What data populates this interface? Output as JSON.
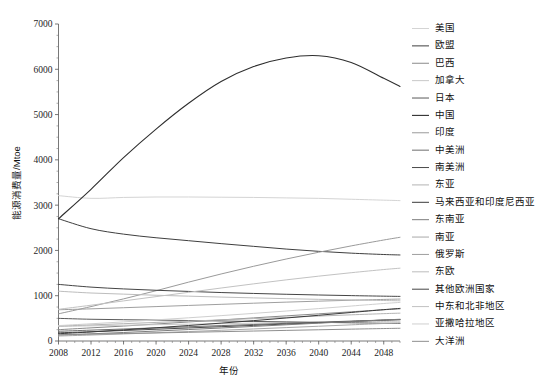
{
  "chart_data": {
    "type": "line",
    "title": "",
    "xlabel": "年份",
    "ylabel": "能源消费量/Mtoe",
    "xlim": [
      2008,
      2050
    ],
    "ylim": [
      0,
      7000
    ],
    "grid": false,
    "legend_position": "right",
    "xticks": [
      2008,
      2012,
      2016,
      2020,
      2024,
      2028,
      2032,
      2036,
      2040,
      2044,
      2048
    ],
    "yticks": [
      0,
      1000,
      2000,
      3000,
      4000,
      5000,
      6000,
      7000
    ],
    "xtick_labels": [
      "2008",
      "2012",
      "2016",
      "2020",
      "2024",
      "2028",
      "2032",
      "2036",
      "2040",
      "2044",
      "2048"
    ],
    "ytick_labels": [
      "0",
      "1000",
      "2000",
      "3000",
      "4000",
      "5000",
      "6000",
      "7000"
    ],
    "x": [
      2008,
      2012,
      2016,
      2020,
      2024,
      2028,
      2032,
      2036,
      2040,
      2044,
      2048,
      2050
    ],
    "series": [
      {
        "name": "美国",
        "color": "#d4d4d4",
        "width": 1.0,
        "values": [
          3210,
          3150,
          3170,
          3180,
          3180,
          3175,
          3170,
          3160,
          3150,
          3130,
          3110,
          3100
        ]
      },
      {
        "name": "欧盟",
        "color": "#3f3f3f",
        "width": 1.0,
        "values": [
          2700,
          2480,
          2360,
          2280,
          2215,
          2150,
          2090,
          2030,
          1980,
          1940,
          1910,
          1900
        ]
      },
      {
        "name": "巴西",
        "color": "#8a8a8a",
        "width": 1.0,
        "values": [
          250,
          290,
          330,
          375,
          420,
          465,
          510,
          555,
          600,
          645,
          690,
          710
        ]
      },
      {
        "name": "加拿大",
        "color": "#c9c9c9",
        "width": 1.0,
        "values": [
          320,
          335,
          348,
          360,
          372,
          383,
          394,
          404,
          414,
          423,
          432,
          436
        ]
      },
      {
        "name": "日本",
        "color": "#5a5a5a",
        "width": 1.0,
        "values": [
          500,
          480,
          470,
          462,
          452,
          442,
          432,
          422,
          412,
          402,
          392,
          388
        ]
      },
      {
        "name": "中国",
        "color": "#2e2e2e",
        "width": 1.1,
        "values": [
          2700,
          3350,
          4050,
          4680,
          5250,
          5730,
          6060,
          6250,
          6300,
          6150,
          5800,
          5620
        ]
      },
      {
        "name": "印度",
        "color": "#9a9a9a",
        "width": 1.0,
        "values": [
          600,
          760,
          930,
          1110,
          1300,
          1480,
          1650,
          1810,
          1960,
          2100,
          2230,
          2290
        ]
      },
      {
        "name": "中美洲",
        "color": "#6e6e6e",
        "width": 1.0,
        "values": [
          215,
          240,
          265,
          290,
          315,
          340,
          365,
          390,
          415,
          440,
          462,
          472
        ]
      },
      {
        "name": "南美洲",
        "color": "#4a4a4a",
        "width": 1.0,
        "values": [
          180,
          205,
          232,
          260,
          288,
          316,
          345,
          374,
          403,
          432,
          460,
          472
        ]
      },
      {
        "name": "东亚",
        "color": "#b4b4b4",
        "width": 1.0,
        "values": [
          330,
          355,
          382,
          410,
          438,
          466,
          494,
          522,
          550,
          578,
          604,
          615
        ]
      },
      {
        "name": "马来西亚和印度尼西亚",
        "color": "#3a3a3a",
        "width": 1.0,
        "values": [
          160,
          200,
          245,
          292,
          342,
          395,
          450,
          508,
          568,
          630,
          692,
          720
        ]
      },
      {
        "name": "东南亚",
        "color": "#7d7d7d",
        "width": 1.0,
        "values": [
          130,
          158,
          188,
          220,
          253,
          287,
          322,
          358,
          394,
          430,
          464,
          480
        ]
      },
      {
        "name": "南亚",
        "color": "#a8a8a8",
        "width": 1.0,
        "values": [
          110,
          132,
          156,
          182,
          209,
          237,
          266,
          296,
          326,
          357,
          387,
          400
        ]
      },
      {
        "name": "俄罗斯",
        "color": "#9f9f9f",
        "width": 1.0,
        "values": [
          690,
          710,
          735,
          760,
          785,
          810,
          835,
          858,
          880,
          900,
          918,
          926
        ]
      },
      {
        "name": "东欧",
        "color": "#bdbdbd",
        "width": 1.0,
        "values": [
          1100,
          1060,
          1035,
          1010,
          990,
          970,
          952,
          935,
          920,
          906,
          894,
          888
        ]
      },
      {
        "name": "其他欧洲国家",
        "color": "#454545",
        "width": 1.0,
        "values": [
          1250,
          1190,
          1150,
          1120,
          1095,
          1070,
          1050,
          1032,
          1016,
          1002,
          990,
          985
        ]
      },
      {
        "name": "中东和北非地区",
        "color": "#c2c2c2",
        "width": 1.0,
        "values": [
          700,
          790,
          885,
          980,
          1075,
          1170,
          1262,
          1350,
          1432,
          1508,
          1578,
          1608
        ]
      },
      {
        "name": "亚撒哈拉地区",
        "color": "#cfcfcf",
        "width": 1.0,
        "values": [
          340,
          380,
          422,
          466,
          512,
          560,
          610,
          662,
          716,
          772,
          828,
          852
        ]
      },
      {
        "name": "大洋洲",
        "color": "#8f8f8f",
        "width": 1.0,
        "values": [
          140,
          152,
          165,
          178,
          192,
          206,
          220,
          234,
          248,
          262,
          275,
          281
        ]
      }
    ]
  },
  "legend": {
    "items": [
      {
        "label": "美国"
      },
      {
        "label": "欧盟"
      },
      {
        "label": "巴西"
      },
      {
        "label": "加拿大"
      },
      {
        "label": "日本"
      },
      {
        "label": "中国"
      },
      {
        "label": "印度"
      },
      {
        "label": "中美洲"
      },
      {
        "label": "南美洲"
      },
      {
        "label": "东亚"
      },
      {
        "label": "马来西亚和印度尼西亚"
      },
      {
        "label": "东南亚"
      },
      {
        "label": "南亚"
      },
      {
        "label": "俄罗斯"
      },
      {
        "label": "东欧"
      },
      {
        "label": "其他欧洲国家"
      },
      {
        "label": "中东和北非地区"
      },
      {
        "label": "亚撒哈拉地区"
      },
      {
        "label": "大洋洲"
      }
    ]
  }
}
